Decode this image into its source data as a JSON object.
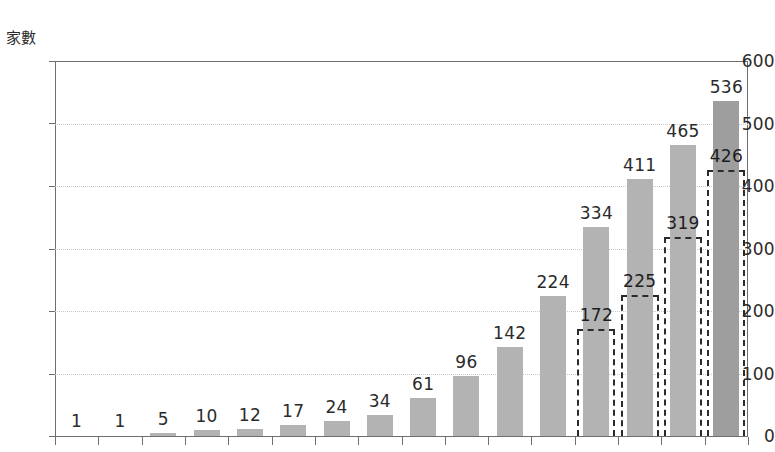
{
  "chart_data": {
    "type": "bar",
    "title": "",
    "subtitle": "",
    "xlabel": "",
    "ylabel": "家數",
    "ylim": [
      0,
      600
    ],
    "y_ticks": [
      0,
      100,
      200,
      300,
      400,
      500,
      600
    ],
    "grid": true,
    "legend": "none",
    "categories": [
      "",
      "",
      "",
      "",
      "",
      "",
      "",
      "",
      "",
      "",
      "",
      "",
      "",
      "",
      "",
      ""
    ],
    "series": [
      {
        "name": "實線柱",
        "style": "solid-fill",
        "values": [
          1,
          1,
          5,
          10,
          12,
          17,
          24,
          34,
          61,
          96,
          142,
          224,
          334,
          411,
          465,
          536
        ]
      },
      {
        "name": "虛線柱",
        "style": "dashed-outline",
        "values": [
          null,
          null,
          null,
          null,
          null,
          null,
          null,
          null,
          null,
          null,
          null,
          null,
          172,
          225,
          319,
          426
        ]
      }
    ]
  },
  "axis": {
    "y_unit_label": "家數",
    "y_tick_labels": [
      "600",
      "500",
      "400",
      "300",
      "200",
      "100",
      "0"
    ]
  },
  "labels": {
    "solid": [
      "1",
      "1",
      "5",
      "10",
      "12",
      "17",
      "24",
      "34",
      "61",
      "96",
      "142",
      "224",
      "334",
      "411",
      "465",
      "536"
    ],
    "dashed": [
      "172",
      "225",
      "319",
      "426"
    ]
  },
  "colors": {
    "bar_fill": "#b3b3b3",
    "bar_fill_dark": "#9e9e9e",
    "dashed_stroke": "#2b2b2b",
    "grid": "#c9c9c9",
    "axis": "#6f6f6f",
    "text": "#2b2b2b",
    "background": "#ffffff"
  }
}
